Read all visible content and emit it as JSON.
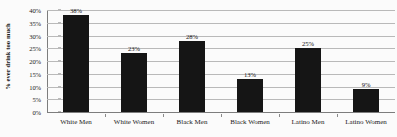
{
  "chart_data": {
    "type": "bar",
    "title": "",
    "xlabel": "",
    "ylabel": "% ever drink too much",
    "categories": [
      "White Men",
      "White Women",
      "Black Men",
      "Black Women",
      "Latino Men",
      "Latino Women"
    ],
    "values": [
      38,
      23,
      28,
      13,
      25,
      9
    ],
    "value_labels": [
      "38%",
      "23%",
      "28%",
      "13%",
      "25%",
      "9%"
    ],
    "ylim": [
      0,
      40
    ],
    "ytick_values": [
      0,
      5,
      10,
      15,
      20,
      25,
      30,
      35,
      40
    ],
    "ytick_labels": [
      "0%",
      "5%",
      "10%",
      "15%",
      "20%",
      "25%",
      "30%",
      "35%",
      "40%"
    ],
    "grid": true,
    "legend": "none",
    "bar_color": "#151515",
    "gridline_color": "#b9b9b9",
    "axis_color": "#7d7d7d",
    "background_color": "#fbfbfb"
  }
}
